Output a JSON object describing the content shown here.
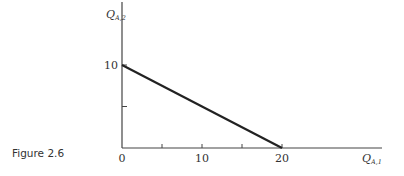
{
  "caption": "Figure 2.6",
  "chart_data": {
    "type": "line",
    "title": "",
    "xlabel": "Q_{A,1}",
    "ylabel": "Q_{A,2}",
    "x_label_main": "Q",
    "x_label_sub": "A,1",
    "y_label_main": "Q",
    "y_label_sub": "A,2",
    "xlim": [
      0,
      25
    ],
    "ylim": [
      0,
      17
    ],
    "x_ticks": [
      0,
      5,
      10,
      15,
      20
    ],
    "x_tick_labels": [
      "0",
      "",
      "10",
      "",
      "20"
    ],
    "y_ticks": [
      0,
      5,
      10
    ],
    "y_tick_labels": [
      "",
      "",
      "10"
    ],
    "grid": false,
    "legend": null,
    "series": [
      {
        "name": "budget line",
        "x": [
          0,
          20
        ],
        "y": [
          10,
          0
        ]
      }
    ]
  }
}
